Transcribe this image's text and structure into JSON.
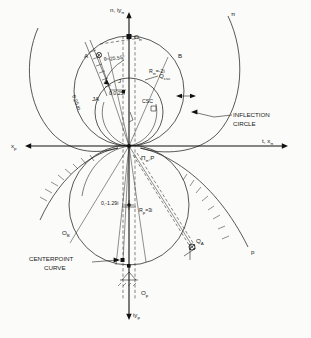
{
  "figure": {
    "background": "#fbfbf9",
    "ink": "#1a1a1a"
  },
  "axes": {
    "top_label": "n, iy",
    "top_sub": "π",
    "right_label": "t, x",
    "right_sub": "π",
    "left_label": "x",
    "left_sub": "p",
    "bottom_label": "iy",
    "bottom_sub": "p"
  },
  "labels": {
    "point_A": "A",
    "point_B": "B",
    "origin_pi": "O",
    "origin_pi_sub": "π",
    "origin_p": "O",
    "origin_p_sub": "p",
    "center_B": "O",
    "center_B_sub": "B",
    "point_QA": "Q",
    "point_QA_sub": "A",
    "point_Qcsc": "Q",
    "point_Qcsc_sub": "csc",
    "point_J": "J",
    "point_JA": "JA",
    "csc": "CSC",
    "pole": "Π",
    "pole_sub": "π",
    "pole_p": "P",
    "curve_pi": "π",
    "curve_p": "p"
  },
  "annotations": {
    "theta": "θ=25.55°",
    "r_pi": "R",
    "r_pi_sub": "π",
    "r_pi_val": "=-2i",
    "r_p": "R",
    "r_p_sub": "p",
    "r_p_val": "=3i",
    "coord_j": "0,0.25i",
    "coord_ob": "0,-1.29i",
    "len_A": "0.25 in.",
    "inflection_circle_line1": "INFLECTION",
    "inflection_circle_line2": "CIRCLE",
    "centerpoint_curve_line1": "CENTERPOINT",
    "centerpoint_curve_line2": "CURVE"
  },
  "geometry": {
    "origin_px": [
      129,
      146
    ],
    "inflection_circle_center_px": [
      129,
      112
    ],
    "inflection_circle_r_px": 34,
    "upper_large_circle_center_px": [
      129,
      91
    ],
    "upper_large_circle_r_px": 55,
    "lower_circle_center_px": [
      129,
      205
    ],
    "lower_circle_r_px": 60,
    "theta_deg": 25.55
  }
}
